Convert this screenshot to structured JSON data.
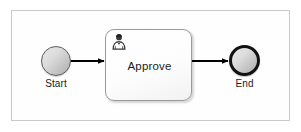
{
  "diagram": {
    "type": "bpmn-process-flow",
    "frame": {
      "border_color": "#c9c9cc",
      "background": "#ffffff"
    },
    "nodes": [
      {
        "id": "start",
        "kind": "start-event",
        "shape": "circle",
        "label": "Start",
        "label_position": "below",
        "fill": "#dcdcdc",
        "stroke": "#5b5b5b",
        "stroke_width": 1.5
      },
      {
        "id": "approve",
        "kind": "user-task",
        "shape": "rounded-rectangle",
        "label": "Approve",
        "label_position": "center",
        "icon": "user-task-icon",
        "fill": "#ffffff",
        "stroke": "#9a9a9a",
        "stroke_width": 1
      },
      {
        "id": "end",
        "kind": "end-event",
        "shape": "circle",
        "label": "End",
        "label_position": "below",
        "fill": "#dcdcdc",
        "stroke": "#111111",
        "stroke_width": 3
      }
    ],
    "connectors": [
      {
        "id": "flow-start-approve",
        "kind": "sequence-flow",
        "from": "start",
        "to": "approve",
        "label": "",
        "color": "#000000"
      },
      {
        "id": "flow-approve-end",
        "kind": "sequence-flow",
        "from": "approve",
        "to": "end",
        "label": "",
        "color": "#000000"
      }
    ]
  }
}
